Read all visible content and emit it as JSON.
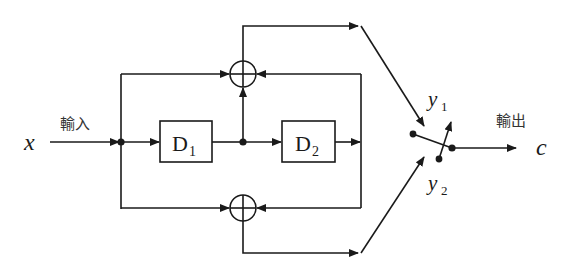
{
  "diagram": {
    "type": "block-diagram",
    "colors": {
      "stroke": "#1a1a1a",
      "background": "#ffffff"
    },
    "input": {
      "symbol": "x",
      "label": "輸入"
    },
    "output": {
      "symbol": "c",
      "label": "輸出"
    },
    "blocks": [
      {
        "id": "D1",
        "letter": "D",
        "subscript": "1"
      },
      {
        "id": "D2",
        "letter": "D",
        "subscript": "2"
      }
    ],
    "summers": [
      {
        "id": "top-summer",
        "symbol": "⊕"
      },
      {
        "id": "bottom-summer",
        "symbol": "⊕"
      }
    ],
    "switch_inputs": [
      {
        "letter": "y",
        "subscript": "1"
      },
      {
        "letter": "y",
        "subscript": "2"
      }
    ]
  }
}
